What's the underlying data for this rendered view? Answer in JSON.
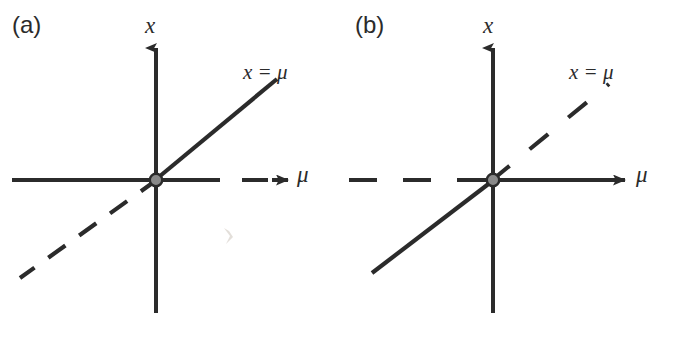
{
  "figure": {
    "type": "bifurcation-diagram",
    "panel_count": 2,
    "background_color": "#ffffff",
    "ink_color": "#2b2b2b",
    "origin_dot_fill": "#8a8a8a",
    "origin_dot_stroke": "#2b2b2b",
    "width": 674,
    "height": 338
  },
  "panels": [
    {
      "id": "a",
      "label": "(a)",
      "axes": {
        "vertical_label": "x",
        "horizontal_label": "μ",
        "origin": {
          "x": 156,
          "y": 180
        },
        "vertical": {
          "x": 156,
          "top": 42,
          "bottom": 313,
          "style": "solid",
          "arrow": "up"
        },
        "horizontal_left": {
          "from_x": 12,
          "to_x": 156,
          "y": 180,
          "style": "solid"
        },
        "horizontal_right": {
          "from_x": 156,
          "to_x": 285,
          "y": 180,
          "style": "dashed",
          "arrow": "right"
        }
      },
      "curves": [
        {
          "label": "x = μ",
          "branch": "upper-right",
          "style": "solid",
          "from": {
            "x": 156,
            "y": 180
          },
          "to": {
            "x": 276,
            "y": 80
          }
        },
        {
          "label": "x = μ",
          "branch": "lower-left",
          "style": "dashed",
          "from": {
            "x": 156,
            "y": 180
          },
          "to": {
            "x": 20,
            "y": 277
          }
        }
      ],
      "line_label": "x = μ",
      "stability": {
        "upper_right_branch": "stable",
        "lower_left_branch": "unstable",
        "axis_left": "stable",
        "axis_right": "unstable"
      }
    },
    {
      "id": "b",
      "label": "(b)",
      "axes": {
        "vertical_label": "x",
        "horizontal_label": "μ",
        "origin": {
          "x": 156,
          "y": 180
        },
        "vertical": {
          "x": 156,
          "top": 42,
          "bottom": 313,
          "style": "solid",
          "arrow": "up"
        },
        "horizontal_left": {
          "from_x": 12,
          "to_x": 156,
          "y": 180,
          "style": "dashed"
        },
        "horizontal_right": {
          "from_x": 156,
          "to_x": 290,
          "y": 180,
          "style": "solid",
          "arrow": "right"
        }
      },
      "curves": [
        {
          "label": "x = μ",
          "branch": "upper-right",
          "style": "dashed",
          "from": {
            "x": 156,
            "y": 180
          },
          "to": {
            "x": 271,
            "y": 85
          }
        },
        {
          "label": "x = μ",
          "branch": "lower-left",
          "style": "solid",
          "from": {
            "x": 156,
            "y": 180
          },
          "to": {
            "x": 35,
            "y": 272
          }
        }
      ],
      "line_label": "x = μ",
      "stability": {
        "upper_right_branch": "unstable",
        "lower_left_branch": "stable",
        "axis_left": "unstable",
        "axis_right": "stable"
      }
    }
  ]
}
